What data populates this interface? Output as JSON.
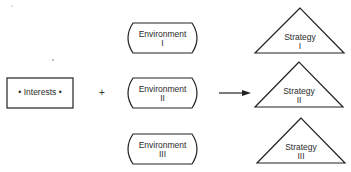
{
  "diagram": {
    "interests": {
      "label": "• Interests •"
    },
    "operator": "+",
    "environments": [
      {
        "name": "Environment",
        "numeral": "I"
      },
      {
        "name": "Environment",
        "numeral": "II"
      },
      {
        "name": "Environment",
        "numeral": "III"
      }
    ],
    "strategies": [
      {
        "name": "Strategy",
        "numeral": "I"
      },
      {
        "name": "Strategy",
        "numeral": "II"
      },
      {
        "name": "Strategy",
        "numeral": "III"
      }
    ],
    "arrow": {
      "from": "Environment II",
      "to": "Strategy II"
    }
  }
}
